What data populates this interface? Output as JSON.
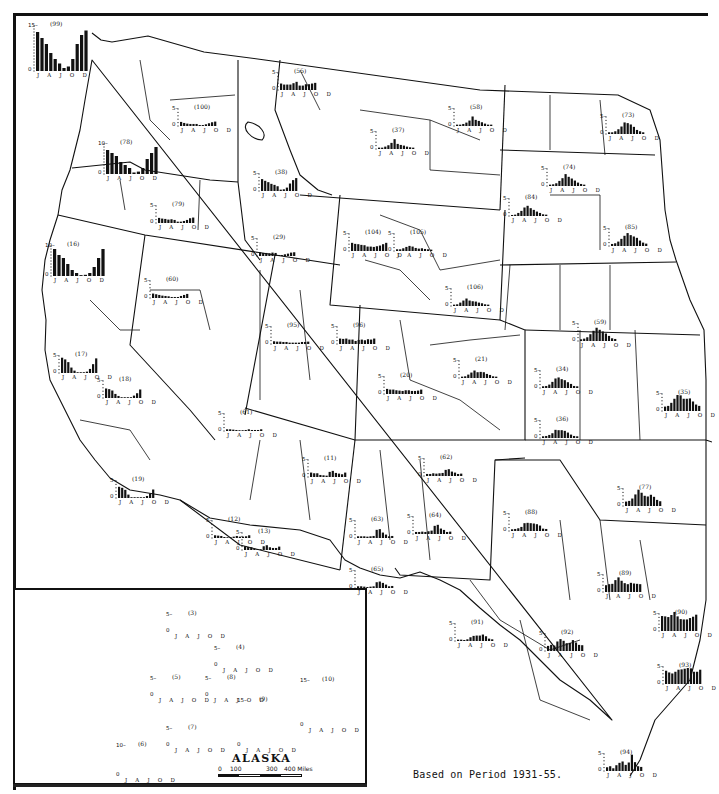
{
  "map": {
    "caption": "Based on Period 1931-55.",
    "inset": {
      "title": "ALASKA",
      "scale": {
        "labels": [
          "0",
          "100",
          "300",
          "400 Miles"
        ]
      }
    },
    "month_axis_labels": "J A J O D",
    "unit_note": "Monthly precipitation bars by climate division (inches)"
  },
  "chart_data": {
    "type": "bar",
    "xlabel": "",
    "ylabel": "",
    "categories": [
      "J",
      "F",
      "M",
      "A",
      "M",
      "J",
      "J",
      "A",
      "S",
      "O",
      "N",
      "D"
    ],
    "tick_labels": [
      "J",
      "A",
      "J",
      "O",
      "D"
    ],
    "note": "Based on Period 1931-55.",
    "divisions": [
      {
        "id": "99",
        "x": 28,
        "y": 15,
        "ymax": 15,
        "values": [
          13,
          11,
          9,
          6,
          4,
          2.5,
          1,
          1.5,
          4,
          9,
          12,
          13.5
        ]
      },
      {
        "id": "100",
        "x": 172,
        "y": 100,
        "ymax": 5,
        "values": [
          1.2,
          0.9,
          0.7,
          0.6,
          0.6,
          0.6,
          0.3,
          0.3,
          0.5,
          0.8,
          1.1,
          1.3
        ]
      },
      {
        "id": "78",
        "x": 98,
        "y": 133,
        "ymax": 10,
        "values": [
          8,
          7,
          6,
          4,
          3,
          2,
          0.5,
          0.8,
          2,
          5,
          7,
          9
        ]
      },
      {
        "id": "79",
        "x": 150,
        "y": 197,
        "ymax": 5,
        "values": [
          1.5,
          1.3,
          1.2,
          1.0,
          1.1,
          0.9,
          0.4,
          0.4,
          0.6,
          0.9,
          1.4,
          1.6
        ]
      },
      {
        "id": "55",
        "x": 272,
        "y": 64,
        "ymax": 5,
        "values": [
          1.9,
          1.6,
          1.6,
          1.6,
          2.0,
          2.4,
          1.3,
          1.3,
          1.7,
          1.7,
          1.9,
          2.1
        ]
      },
      {
        "id": "37",
        "x": 370,
        "y": 123,
        "ymax": 5,
        "values": [
          0.4,
          0.4,
          0.7,
          1.1,
          1.8,
          2.9,
          1.5,
          1.2,
          1.0,
          0.7,
          0.5,
          0.4
        ]
      },
      {
        "id": "58",
        "x": 448,
        "y": 100,
        "ymax": 5,
        "values": [
          0.4,
          0.4,
          0.6,
          1.0,
          1.6,
          2.8,
          1.8,
          1.5,
          1.1,
          0.7,
          0.4,
          0.4
        ]
      },
      {
        "id": "73",
        "x": 600,
        "y": 108,
        "ymax": 5,
        "values": [
          0.5,
          0.5,
          0.8,
          1.4,
          2.2,
          3.4,
          3.2,
          2.8,
          2.1,
          1.2,
          0.8,
          0.5
        ]
      },
      {
        "id": "74",
        "x": 541,
        "y": 160,
        "ymax": 5,
        "values": [
          0.4,
          0.5,
          0.8,
          1.5,
          2.3,
          3.5,
          2.7,
          2.2,
          1.6,
          1.0,
          0.6,
          0.4
        ]
      },
      {
        "id": "84",
        "x": 503,
        "y": 190,
        "ymax": 5,
        "values": [
          0.3,
          0.4,
          0.9,
          1.5,
          2.5,
          3.0,
          2.3,
          1.8,
          1.3,
          0.9,
          0.5,
          0.4
        ]
      },
      {
        "id": "85",
        "x": 603,
        "y": 220,
        "ymax": 5,
        "values": [
          0.6,
          0.8,
          1.3,
          2.1,
          3.0,
          3.8,
          3.2,
          2.8,
          2.4,
          1.6,
          1.0,
          0.7
        ]
      },
      {
        "id": "38",
        "x": 253,
        "y": 165,
        "ymax": 5,
        "values": [
          3.5,
          3.0,
          2.6,
          2.1,
          1.8,
          1.4,
          0.4,
          0.5,
          1.0,
          2.2,
          3.2,
          3.8
        ]
      },
      {
        "id": "29",
        "x": 251,
        "y": 230,
        "ymax": 5,
        "values": [
          1.1,
          0.9,
          0.9,
          0.8,
          1.0,
          0.9,
          0.3,
          0.3,
          0.5,
          0.7,
          1.0,
          1.1
        ]
      },
      {
        "id": "104",
        "x": 343,
        "y": 225,
        "ymax": 5,
        "values": [
          2.4,
          2.1,
          2.0,
          1.8,
          1.7,
          1.3,
          1.3,
          1.2,
          1.4,
          1.6,
          2.0,
          2.4
        ]
      },
      {
        "id": "105",
        "x": 388,
        "y": 225,
        "ymax": 5,
        "values": [
          0.5,
          0.5,
          0.8,
          1.2,
          1.5,
          1.3,
          0.9,
          0.7,
          0.8,
          0.6,
          0.5,
          0.4
        ]
      },
      {
        "id": "106",
        "x": 445,
        "y": 280,
        "ymax": 5,
        "values": [
          0.4,
          0.5,
          1.0,
          1.6,
          2.2,
          1.6,
          1.4,
          1.3,
          1.0,
          0.8,
          0.5,
          0.4
        ]
      },
      {
        "id": "59",
        "x": 572,
        "y": 315,
        "ymax": 5,
        "values": [
          0.5,
          0.7,
          1.1,
          2.0,
          3.0,
          3.9,
          3.3,
          2.8,
          2.2,
          1.5,
          0.8,
          0.6
        ]
      },
      {
        "id": "34",
        "x": 534,
        "y": 362,
        "ymax": 5,
        "values": [
          0.5,
          0.6,
          1.0,
          1.8,
          2.8,
          3.1,
          2.6,
          2.3,
          1.7,
          1.2,
          0.6,
          0.5
        ]
      },
      {
        "id": "36",
        "x": 534,
        "y": 412,
        "ymax": 5,
        "values": [
          0.5,
          0.6,
          0.9,
          1.4,
          2.4,
          2.3,
          2.3,
          2.1,
          1.6,
          1.0,
          0.6,
          0.5
        ]
      },
      {
        "id": "35",
        "x": 656,
        "y": 385,
        "ymax": 5,
        "values": [
          1.3,
          1.5,
          2.4,
          3.6,
          4.7,
          4.6,
          3.6,
          3.6,
          3.7,
          2.8,
          1.9,
          1.5
        ]
      },
      {
        "id": "16",
        "x": 45,
        "y": 235,
        "ymax": 10,
        "values": [
          9,
          7,
          6,
          4,
          2,
          1,
          0.3,
          0.4,
          1,
          3,
          6,
          9
        ]
      },
      {
        "id": "60",
        "x": 144,
        "y": 272,
        "ymax": 5,
        "values": [
          1.3,
          1.1,
          0.9,
          0.7,
          0.6,
          0.5,
          0.3,
          0.3,
          0.3,
          0.6,
          0.9,
          1.2
        ]
      },
      {
        "id": "17",
        "x": 53,
        "y": 347,
        "ymax": 5,
        "values": [
          4.5,
          4.0,
          3.2,
          1.6,
          0.7,
          0.2,
          0.0,
          0.1,
          0.4,
          1.2,
          2.6,
          4.3
        ]
      },
      {
        "id": "18",
        "x": 97,
        "y": 372,
        "ymax": 5,
        "values": [
          2.8,
          2.6,
          2.2,
          1.2,
          0.6,
          0.2,
          0.1,
          0.1,
          0.2,
          0.7,
          1.4,
          2.5
        ]
      },
      {
        "id": "19",
        "x": 110,
        "y": 472,
        "ymax": 5,
        "values": [
          3.3,
          3.0,
          2.4,
          1.0,
          0.2,
          0.1,
          0.0,
          0.1,
          0.2,
          0.6,
          1.3,
          2.5
        ]
      },
      {
        "id": "95",
        "x": 265,
        "y": 318,
        "ymax": 5,
        "values": [
          0.8,
          0.7,
          0.7,
          0.6,
          0.6,
          0.4,
          0.4,
          0.4,
          0.4,
          0.6,
          0.6,
          0.7
        ]
      },
      {
        "id": "96",
        "x": 331,
        "y": 318,
        "ymax": 5,
        "values": [
          1.6,
          1.5,
          1.6,
          1.3,
          1.3,
          0.9,
          1.2,
          1.3,
          1.1,
          1.4,
          1.3,
          1.6
        ]
      },
      {
        "id": "61",
        "x": 218,
        "y": 405,
        "ymax": 5,
        "values": [
          0.5,
          0.5,
          0.4,
          0.3,
          0.2,
          0.1,
          0.3,
          0.5,
          0.3,
          0.3,
          0.3,
          0.5
        ]
      },
      {
        "id": "20",
        "x": 378,
        "y": 368,
        "ymax": 5,
        "values": [
          1.5,
          1.3,
          1.3,
          1.1,
          1.0,
          0.9,
          1.1,
          1.1,
          0.9,
          0.9,
          1.0,
          1.3
        ]
      },
      {
        "id": "21",
        "x": 453,
        "y": 352,
        "ymax": 5,
        "values": [
          0.4,
          0.5,
          1.0,
          1.6,
          2.2,
          1.7,
          1.8,
          1.7,
          1.2,
          0.9,
          0.5,
          0.4
        ]
      },
      {
        "id": "11",
        "x": 302,
        "y": 451,
        "ymax": 5,
        "values": [
          1.3,
          1.1,
          1.1,
          0.6,
          0.5,
          0.4,
          1.5,
          1.8,
          1.2,
          1.0,
          0.8,
          1.3
        ]
      },
      {
        "id": "62",
        "x": 418,
        "y": 450,
        "ymax": 5,
        "values": [
          0.6,
          0.6,
          0.8,
          0.7,
          0.8,
          0.9,
          1.8,
          2.0,
          1.3,
          1.0,
          0.6,
          0.7
        ]
      },
      {
        "id": "88",
        "x": 503,
        "y": 505,
        "ymax": 5,
        "values": [
          0.5,
          0.6,
          0.8,
          1.2,
          2.3,
          2.4,
          2.3,
          2.2,
          2.0,
          1.6,
          0.7,
          0.6
        ]
      },
      {
        "id": "77",
        "x": 617,
        "y": 480,
        "ymax": 5,
        "values": [
          1.3,
          1.5,
          2.2,
          3.4,
          4.8,
          3.9,
          3.0,
          2.8,
          3.3,
          2.7,
          1.8,
          1.4
        ]
      },
      {
        "id": "12",
        "x": 206,
        "y": 512,
        "ymax": 5,
        "values": [
          0.8,
          0.7,
          0.6,
          0.3,
          0.2,
          0.1,
          0.4,
          0.6,
          0.4,
          0.4,
          0.5,
          0.8
        ]
      },
      {
        "id": "13",
        "x": 236,
        "y": 524,
        "ymax": 5,
        "values": [
          1.1,
          0.9,
          0.8,
          0.4,
          0.3,
          0.2,
          1.1,
          1.4,
          0.8,
          0.6,
          0.6,
          1.0
        ]
      },
      {
        "id": "63",
        "x": 349,
        "y": 512,
        "ymax": 5,
        "values": [
          0.5,
          0.5,
          0.5,
          0.4,
          0.5,
          0.6,
          2.4,
          2.6,
          1.6,
          1.0,
          0.5,
          0.6
        ]
      },
      {
        "id": "64",
        "x": 407,
        "y": 508,
        "ymax": 5,
        "values": [
          0.6,
          0.6,
          0.7,
          0.6,
          0.8,
          1.0,
          2.4,
          2.7,
          1.6,
          1.2,
          0.6,
          0.7
        ]
      },
      {
        "id": "65",
        "x": 349,
        "y": 562,
        "ymax": 5,
        "values": [
          0.5,
          0.5,
          0.4,
          0.3,
          0.4,
          0.5,
          1.7,
          1.9,
          1.5,
          1.0,
          0.5,
          0.6
        ]
      },
      {
        "id": "89",
        "x": 597,
        "y": 566,
        "ymax": 5,
        "values": [
          2.0,
          2.3,
          2.4,
          3.5,
          4.3,
          3.3,
          2.6,
          2.3,
          2.7,
          2.5,
          2.4,
          2.3
        ]
      },
      {
        "id": "91",
        "x": 449,
        "y": 615,
        "ymax": 5,
        "values": [
          0.4,
          0.4,
          0.3,
          0.5,
          1.1,
          1.5,
          1.6,
          1.6,
          1.9,
          1.4,
          0.7,
          0.5
        ]
      },
      {
        "id": "92",
        "x": 539,
        "y": 625,
        "ymax": 5,
        "values": [
          1.5,
          1.8,
          1.6,
          2.8,
          3.5,
          3.0,
          2.3,
          2.4,
          3.2,
          2.5,
          1.8,
          1.7
        ]
      },
      {
        "id": "90",
        "x": 653,
        "y": 605,
        "ymax": 5,
        "values": [
          4.4,
          4.3,
          4.1,
          4.7,
          5.6,
          4.3,
          3.5,
          3.4,
          3.4,
          3.8,
          4.2,
          4.8
        ]
      },
      {
        "id": "93",
        "x": 657,
        "y": 658,
        "ymax": 5,
        "values": [
          3.9,
          3.4,
          3.1,
          3.6,
          4.2,
          4.3,
          4.5,
          4.7,
          4.6,
          3.6,
          3.6,
          4.2
        ]
      },
      {
        "id": "94",
        "x": 598,
        "y": 745,
        "ymax": 5,
        "values": [
          1.1,
          1.4,
          0.8,
          1.7,
          2.4,
          2.8,
          1.8,
          2.5,
          4.8,
          2.6,
          1.4,
          1.2
        ]
      }
    ],
    "alaska_divisions": [
      {
        "id": "3",
        "x": 166,
        "y": 606,
        "ymax": 5,
        "values": [
          0.3,
          0.2,
          0.2,
          0.2,
          0.3,
          0.5,
          1.0,
          1.8,
          1.2,
          0.8,
          0.4,
          0.3
        ]
      },
      {
        "id": "4",
        "x": 214,
        "y": 640,
        "ymax": 5,
        "values": [
          0.5,
          0.4,
          0.3,
          0.3,
          0.5,
          1.4,
          2.0,
          2.2,
          1.3,
          0.8,
          0.6,
          0.5
        ]
      },
      {
        "id": "5",
        "x": 150,
        "y": 670,
        "ymax": 5,
        "values": [
          0.8,
          0.6,
          0.6,
          0.5,
          0.6,
          1.1,
          2.0,
          3.2,
          2.3,
          1.4,
          0.9,
          0.8
        ]
      },
      {
        "id": "8",
        "x": 205,
        "y": 670,
        "ymax": 5,
        "values": [
          1.0,
          0.8,
          0.7,
          0.6,
          0.8,
          1.6,
          2.4,
          3.3,
          2.8,
          1.8,
          1.1,
          1.0
        ]
      },
      {
        "id": "9",
        "x": 237,
        "y": 690,
        "ymax": 15,
        "values": [
          8,
          6.5,
          5.5,
          5,
          6,
          4.5,
          5,
          7.5,
          11,
          13,
          9,
          8.5
        ]
      },
      {
        "id": "10",
        "x": 300,
        "y": 670,
        "ymax": 15,
        "values": [
          9,
          8,
          7,
          6,
          5,
          4,
          5,
          7,
          11,
          14,
          11,
          10
        ]
      },
      {
        "id": "7",
        "x": 166,
        "y": 720,
        "ymax": 5,
        "values": [
          1.2,
          1.1,
          1.0,
          0.9,
          1.0,
          1.4,
          2.2,
          3.4,
          3.8,
          2.9,
          1.7,
          1.4
        ]
      },
      {
        "id": "6",
        "x": 116,
        "y": 735,
        "ymax": 10,
        "values": [
          5.5,
          4.8,
          4.4,
          3.5,
          3.8,
          3.0,
          3.6,
          5.0,
          5.9,
          6.4,
          6.8,
          5.8
        ]
      }
    ]
  }
}
